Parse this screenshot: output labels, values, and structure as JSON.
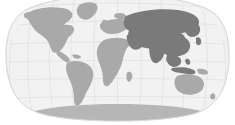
{
  "map": {
    "title": "World Map",
    "projection": "Robinson",
    "background_color": "#ffffff",
    "ocean_color": "#f2f2f2",
    "ocean_border_color": "#d8d8d8",
    "graticule_color": "#dcdcdc",
    "land_color": "#a9a9a9",
    "highlight_color": "#7a7a7a",
    "polar_color": "#b6b6b6",
    "graticule": {
      "meridian_count": 11,
      "parallel_count": 7,
      "meridian_spacing_degrees": 30,
      "parallel_spacing_degrees": 30,
      "visible": true
    },
    "regions": [
      {
        "name": "north-america",
        "label": "North America",
        "highlighted": false,
        "fill": "#a9a9a9"
      },
      {
        "name": "greenland",
        "label": "Greenland",
        "highlighted": false,
        "fill": "#a9a9a9"
      },
      {
        "name": "south-america",
        "label": "South America",
        "highlighted": false,
        "fill": "#a9a9a9"
      },
      {
        "name": "africa",
        "label": "Africa",
        "highlighted": false,
        "fill": "#a9a9a9"
      },
      {
        "name": "europe",
        "label": "Europe",
        "highlighted": false,
        "fill": "#a9a9a9"
      },
      {
        "name": "asia",
        "label": "Asia",
        "highlighted": true,
        "fill": "#7a7a7a"
      },
      {
        "name": "middle-east",
        "label": "Middle East",
        "highlighted": true,
        "fill": "#7a7a7a"
      },
      {
        "name": "india",
        "label": "India",
        "highlighted": true,
        "fill": "#7a7a7a"
      },
      {
        "name": "southeast-asia",
        "label": "Southeast Asia",
        "highlighted": true,
        "fill": "#7a7a7a"
      },
      {
        "name": "australia",
        "label": "Australia",
        "highlighted": false,
        "fill": "#a9a9a9"
      },
      {
        "name": "antarctica",
        "label": "Antarctica",
        "highlighted": false,
        "fill": "#b6b6b6"
      }
    ]
  }
}
